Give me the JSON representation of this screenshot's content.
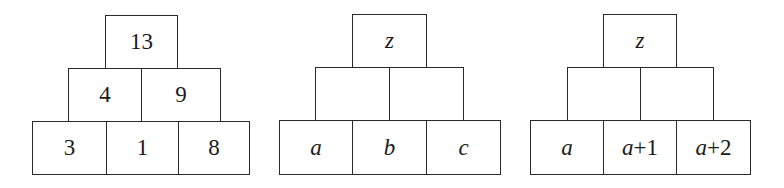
{
  "pyramids": [
    {
      "top": {
        "text": "13",
        "italic": false
      },
      "middle": [
        {
          "text": "4",
          "italic": false
        },
        {
          "text": "9",
          "italic": false
        }
      ],
      "bottom": [
        {
          "text": "3",
          "italic": false
        },
        {
          "text": "1",
          "italic": false
        },
        {
          "text": "8",
          "italic": false
        }
      ]
    },
    {
      "top": {
        "text": "z",
        "italic": true
      },
      "middle": [
        {
          "text": "",
          "italic": false
        },
        {
          "text": "",
          "italic": false
        }
      ],
      "bottom": [
        {
          "text": "a",
          "italic": true
        },
        {
          "text": "b",
          "italic": true
        },
        {
          "text": "c",
          "italic": true
        }
      ]
    },
    {
      "top": {
        "text": "z",
        "italic": true
      },
      "middle": [
        {
          "text": "",
          "italic": false
        },
        {
          "text": "",
          "italic": false
        }
      ],
      "bottom": [
        {
          "text": "a",
          "italic": true
        },
        {
          "var": "a",
          "op": "+",
          "num": "1"
        },
        {
          "var": "a",
          "op": "+",
          "num": "2"
        }
      ]
    }
  ]
}
